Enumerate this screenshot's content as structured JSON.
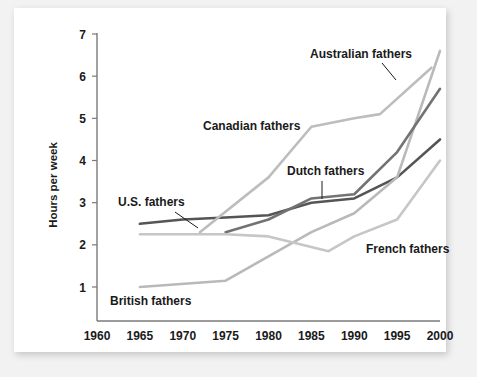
{
  "chart_data": {
    "type": "line",
    "title": "",
    "xlabel": "",
    "ylabel": "Hours per week",
    "xlim": [
      1960,
      2000
    ],
    "ylim": [
      0,
      7.4
    ],
    "xticks": [
      1960,
      1965,
      1970,
      1975,
      1980,
      1985,
      1990,
      1995,
      2000
    ],
    "yticks": [
      1,
      2,
      3,
      4,
      5,
      6,
      7
    ],
    "grid": false,
    "legend_position": "inline-labels",
    "series": [
      {
        "name": "U.S. fathers",
        "color": "#555555",
        "width": 2.6,
        "points": [
          [
            1965,
            2.5
          ],
          [
            1970,
            2.6
          ],
          [
            1975,
            2.65
          ],
          [
            1980,
            2.7
          ],
          [
            1985,
            3.0
          ],
          [
            1990,
            3.1
          ],
          [
            1995,
            3.6
          ],
          [
            2000,
            4.5
          ]
        ]
      },
      {
        "name": "British fathers",
        "color": "#b9b9b9",
        "width": 2.6,
        "points": [
          [
            1965,
            1.0
          ],
          [
            1975,
            1.15
          ],
          [
            1985,
            2.3
          ],
          [
            1990,
            2.75
          ],
          [
            1995,
            3.6
          ],
          [
            2000,
            6.6
          ]
        ]
      },
      {
        "name": "Canadian fathers",
        "color": "#bdbdbd",
        "width": 2.6,
        "points": [
          [
            1972,
            2.3
          ],
          [
            1980,
            3.6
          ],
          [
            1985,
            4.8
          ],
          [
            1990,
            5.0
          ],
          [
            1993,
            5.1
          ],
          [
            1999,
            6.2
          ]
        ]
      },
      {
        "name": "Dutch fathers",
        "color": "#737373",
        "width": 2.6,
        "points": [
          [
            1975,
            2.3
          ],
          [
            1980,
            2.6
          ],
          [
            1985,
            3.1
          ],
          [
            1990,
            3.2
          ],
          [
            1995,
            4.2
          ],
          [
            2000,
            5.7
          ]
        ]
      },
      {
        "name": "French fathers",
        "color": "#c6c6c6",
        "width": 2.6,
        "points": [
          [
            1965,
            2.25
          ],
          [
            1975,
            2.25
          ],
          [
            1980,
            2.2
          ],
          [
            1987,
            1.85
          ],
          [
            1990,
            2.2
          ],
          [
            1995,
            2.6
          ],
          [
            2000,
            4.0
          ]
        ]
      }
    ],
    "annotations": [
      {
        "label": "U.S. fathers",
        "x": 118,
        "y": 206,
        "leader": [
          [
            175,
            212
          ],
          [
            198,
            228
          ]
        ]
      },
      {
        "label": "British fathers",
        "x": 110,
        "y": 305,
        "leader": null
      },
      {
        "label": "Canadian fathers",
        "x": 203,
        "y": 130,
        "leader": null
      },
      {
        "label": "Dutch fathers",
        "x": 287,
        "y": 175,
        "leader": [
          [
            322,
            181
          ],
          [
            322,
            199
          ]
        ]
      },
      {
        "label": "Australian fathers",
        "x": 310,
        "y": 58,
        "leader": [
          [
            382,
            63
          ],
          [
            396,
            80
          ]
        ]
      },
      {
        "label": "French fathers",
        "x": 366,
        "y": 253,
        "leader": null
      }
    ]
  },
  "axis": {
    "y_title": "Hours per week",
    "x_tick_labels": [
      "1960",
      "1965",
      "1970",
      "1975",
      "1980",
      "1985",
      "1990",
      "1995",
      "2000"
    ],
    "y_tick_labels": [
      "1",
      "2",
      "3",
      "4",
      "5",
      "6",
      "7"
    ]
  },
  "colors": {
    "page_background": "#f2f2f2",
    "card_background": "#ffffff",
    "axis": "#7a7a7a",
    "text": "#1a1a1a"
  }
}
